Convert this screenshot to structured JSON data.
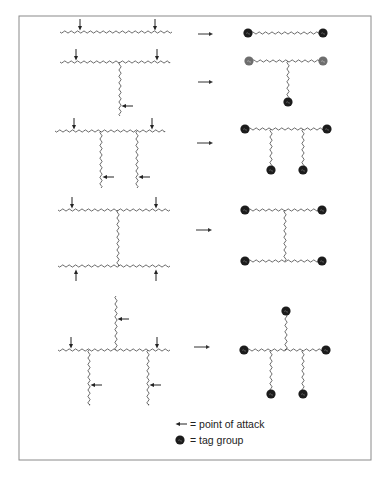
{
  "figure": {
    "frame": {
      "x": 19,
      "y": 16,
      "w": 352,
      "h": 444,
      "stroke": "#8a8a8a"
    },
    "colors": {
      "chain": "#444444",
      "arrow": "#222222",
      "tag": "#1c1c1c",
      "tag_light": "#6e6e6e",
      "reaction_arrow": "#333333"
    },
    "rows": [
      {
        "id": "linear",
        "reactant": {
          "chains": [
            {
              "x1": 60,
              "y1": 32,
              "x2": 172,
              "y2": 32
            }
          ],
          "attack_arrows": [
            {
              "x": 80,
              "y": 32,
              "dir": "down"
            },
            {
              "x": 155,
              "y": 32,
              "dir": "down"
            }
          ]
        },
        "reaction_arrow": {
          "x1": 198,
          "x2": 213,
          "y": 34
        },
        "product": {
          "chains": [
            {
              "x1": 248,
              "y1": 33,
              "x2": 323,
              "y2": 33
            }
          ],
          "tags": [
            {
              "x": 248,
              "y": 33
            },
            {
              "x": 323,
              "y": 33
            }
          ]
        }
      },
      {
        "id": "single-branch",
        "reactant": {
          "chains": [
            {
              "x1": 60,
              "y1": 62,
              "x2": 170,
              "y2": 62
            },
            {
              "x1": 120,
              "y1": 62,
              "x2": 120,
              "y2": 116
            }
          ],
          "attack_arrows": [
            {
              "x": 76,
              "y": 62,
              "dir": "down"
            },
            {
              "x": 157,
              "y": 62,
              "dir": "down"
            },
            {
              "x": 120,
              "y": 106,
              "dir": "left"
            }
          ]
        },
        "reaction_arrow": {
          "x1": 198,
          "x2": 213,
          "y": 82
        },
        "product": {
          "chains": [
            {
              "x1": 249,
              "y1": 61,
              "x2": 323,
              "y2": 61
            },
            {
              "x1": 288,
              "y1": 61,
              "x2": 288,
              "y2": 102
            }
          ],
          "tags": [
            {
              "x": 249,
              "y": 61,
              "light": true
            },
            {
              "x": 323,
              "y": 61,
              "light": true
            },
            {
              "x": 288,
              "y": 102
            }
          ]
        }
      },
      {
        "id": "double-branch",
        "reactant": {
          "chains": [
            {
              "x1": 55,
              "y1": 131,
              "x2": 165,
              "y2": 131
            },
            {
              "x1": 101,
              "y1": 131,
              "x2": 101,
              "y2": 188
            },
            {
              "x1": 137,
              "y1": 131,
              "x2": 137,
              "y2": 188
            }
          ],
          "attack_arrows": [
            {
              "x": 74,
              "y": 131,
              "dir": "down"
            },
            {
              "x": 152,
              "y": 131,
              "dir": "down"
            },
            {
              "x": 101,
              "y": 177,
              "dir": "left"
            },
            {
              "x": 137,
              "y": 177,
              "dir": "left"
            }
          ]
        },
        "reaction_arrow": {
          "x1": 197,
          "x2": 213,
          "y": 143
        },
        "product": {
          "chains": [
            {
              "x1": 245,
              "y1": 129,
              "x2": 327,
              "y2": 129
            },
            {
              "x1": 271,
              "y1": 129,
              "x2": 271,
              "y2": 170
            },
            {
              "x1": 303,
              "y1": 129,
              "x2": 303,
              "y2": 170
            }
          ],
          "tags": [
            {
              "x": 245,
              "y": 129
            },
            {
              "x": 327,
              "y": 129
            },
            {
              "x": 271,
              "y": 170
            },
            {
              "x": 303,
              "y": 170
            }
          ]
        }
      },
      {
        "id": "h-shape",
        "reactant": {
          "chains": [
            {
              "x1": 58,
              "y1": 210,
              "x2": 170,
              "y2": 210
            },
            {
              "x1": 118,
              "y1": 210,
              "x2": 118,
              "y2": 266
            },
            {
              "x1": 58,
              "y1": 266,
              "x2": 170,
              "y2": 266
            }
          ],
          "attack_arrows": [
            {
              "x": 72,
              "y": 210,
              "dir": "down"
            },
            {
              "x": 156,
              "y": 210,
              "dir": "down"
            },
            {
              "x": 76,
              "y": 266,
              "dir": "up"
            },
            {
              "x": 156,
              "y": 266,
              "dir": "up"
            }
          ]
        },
        "reaction_arrow": {
          "x1": 196,
          "x2": 212,
          "y": 230
        },
        "product": {
          "chains": [
            {
              "x1": 245,
              "y1": 210,
              "x2": 322,
              "y2": 210
            },
            {
              "x1": 285,
              "y1": 210,
              "x2": 285,
              "y2": 261
            },
            {
              "x1": 245,
              "y1": 261,
              "x2": 322,
              "y2": 261
            }
          ],
          "tags": [
            {
              "x": 245,
              "y": 210
            },
            {
              "x": 322,
              "y": 210
            },
            {
              "x": 245,
              "y": 261
            },
            {
              "x": 322,
              "y": 261
            }
          ]
        }
      },
      {
        "id": "star-branch",
        "reactant": {
          "chains": [
            {
              "x1": 58,
              "y1": 350,
              "x2": 170,
              "y2": 350
            },
            {
              "x1": 116,
              "y1": 296,
              "x2": 116,
              "y2": 350
            },
            {
              "x1": 89,
              "y1": 350,
              "x2": 89,
              "y2": 405
            },
            {
              "x1": 148,
              "y1": 350,
              "x2": 148,
              "y2": 405
            }
          ],
          "attack_arrows": [
            {
              "x": 71,
              "y": 350,
              "dir": "down"
            },
            {
              "x": 157,
              "y": 350,
              "dir": "down"
            },
            {
              "x": 116,
              "y": 319,
              "dir": "left"
            },
            {
              "x": 89,
              "y": 385,
              "dir": "left"
            },
            {
              "x": 148,
              "y": 385,
              "dir": "left"
            }
          ]
        },
        "reaction_arrow": {
          "x1": 194,
          "x2": 210,
          "y": 347
        },
        "product": {
          "chains": [
            {
              "x1": 244,
              "y1": 350,
              "x2": 326,
              "y2": 350
            },
            {
              "x1": 286,
              "y1": 311,
              "x2": 286,
              "y2": 350
            },
            {
              "x1": 271,
              "y1": 350,
              "x2": 271,
              "y2": 394
            },
            {
              "x1": 303,
              "y1": 350,
              "x2": 303,
              "y2": 394
            }
          ],
          "tags": [
            {
              "x": 286,
              "y": 311
            },
            {
              "x": 244,
              "y": 350
            },
            {
              "x": 326,
              "y": 350
            },
            {
              "x": 271,
              "y": 394
            },
            {
              "x": 303,
              "y": 394
            }
          ]
        }
      }
    ],
    "legend": {
      "items": [
        {
          "symbol": "arrow-left",
          "label": "= point of attack",
          "symbol_x": 180,
          "y": 424,
          "label_x": 190
        },
        {
          "symbol": "tag-dot",
          "label": "= tag group",
          "symbol_x": 180,
          "y": 440,
          "label_x": 190
        }
      ]
    }
  }
}
